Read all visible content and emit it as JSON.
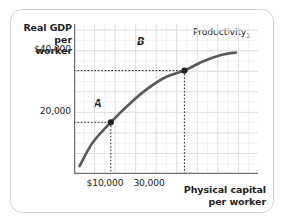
{
  "figure": {
    "border_color": "#d2d2d2",
    "background": "#ffffff"
  },
  "chart_data": {
    "type": "line",
    "title": "",
    "xlabel": "Physical capital\nper worker",
    "ylabel": "Real GDP\nper worker",
    "xlabel_line1": "Physical capital",
    "xlabel_line2": "per worker",
    "ylabel_line1": "Real GDP",
    "ylabel_line2": "per worker",
    "grid": true,
    "grid_color": "#dcdcdc",
    "minor_grid_color": "#ededed",
    "curve_color": "#58595b",
    "point_color": "#231f20",
    "legend_position": "inline-right-of-curve",
    "xlim": [
      0,
      50000
    ],
    "ylim": [
      0,
      58000
    ],
    "xticks": [
      10000,
      30000
    ],
    "xtick_labels": [
      "$10,000",
      "30,000"
    ],
    "yticks": [
      20000,
      40000
    ],
    "ytick_labels": [
      "20,000",
      "$40,000"
    ],
    "series": [
      {
        "name": "Productivity₁",
        "label": "Productivity",
        "label_subscript": "1",
        "x": [
          1500,
          5000,
          10000,
          15000,
          20000,
          25000,
          30000,
          35000,
          40000,
          44000
        ],
        "y": [
          3000,
          12000,
          20000,
          27000,
          33000,
          37500,
          40000,
          43500,
          46000,
          47000
        ]
      }
    ],
    "annotations": [
      {
        "name": "A",
        "label": "A",
        "x": 10000,
        "y": 20000,
        "dashed_guides": [
          "horizontal-to-y-axis",
          "vertical-to-x-axis"
        ]
      },
      {
        "name": "B",
        "label": "B",
        "x": 30000,
        "y": 40000,
        "dashed_guides": [
          "horizontal-to-y-axis",
          "vertical-to-x-axis"
        ]
      }
    ]
  }
}
